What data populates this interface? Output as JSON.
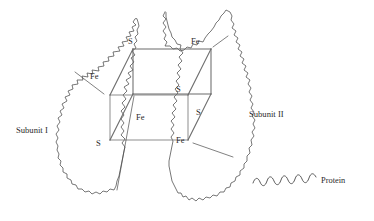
{
  "figure": {
    "type": "schematic-diagram",
    "background_color": "#ffffff",
    "line_color": "#4a4a4a",
    "cube_line_color": "#6b6b6b",
    "text_color": "#2a2a2a"
  },
  "subunits": [
    {
      "id": "subunit-1",
      "label": "Subunit I",
      "position": "left"
    },
    {
      "id": "subunit-2",
      "label": "Subunit II",
      "position": "right"
    }
  ],
  "cluster": {
    "name": "Fe4S4 cube",
    "shape": "cube",
    "vertices": [
      {
        "id": "v-top-back-left",
        "label": "S",
        "element": "S",
        "corner": "top-back-left"
      },
      {
        "id": "v-top-back-right",
        "label": "Fe",
        "element": "Fe",
        "corner": "top-back-right"
      },
      {
        "id": "v-top-front-left",
        "label": "Fe",
        "element": "Fe",
        "corner": "top-front-left"
      },
      {
        "id": "v-top-front-right",
        "label": "S",
        "element": "S",
        "corner": "top-front-right"
      },
      {
        "id": "v-bot-back-left",
        "label": "Fe",
        "element": "Fe",
        "corner": "bottom-back-left"
      },
      {
        "id": "v-bot-back-right",
        "label": "S",
        "element": "S",
        "corner": "bottom-back-right"
      },
      {
        "id": "v-bot-front-left",
        "label": "S",
        "element": "S",
        "corner": "bottom-front-left"
      },
      {
        "id": "v-bot-front-right",
        "label": "Fe",
        "element": "Fe",
        "corner": "bottom-front-right"
      }
    ]
  },
  "legend": {
    "symbol": "wavy-line",
    "label": "Protein"
  }
}
